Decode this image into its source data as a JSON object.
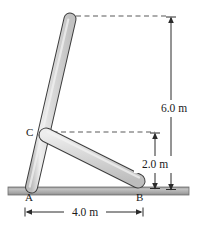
{
  "figure": {
    "title_fragment": "",
    "points": [
      {
        "id": "A",
        "label": "A",
        "x": 31,
        "y": 188,
        "text_x": 25,
        "text_y": 200
      },
      {
        "id": "B",
        "label": "B",
        "x": 140,
        "y": 186,
        "text_x": 137,
        "text_y": 200
      },
      {
        "id": "C",
        "label": "C",
        "x": 44,
        "y": 133,
        "text_x": 26,
        "text_y": 136
      }
    ],
    "dimensions": [
      {
        "id": "height-total",
        "label": "6.0 m",
        "value": 6.0,
        "unit": "m",
        "orientation": "vertical",
        "text_x": 174,
        "text_y": 108
      },
      {
        "id": "height-to-c",
        "label": "2.0 m",
        "value": 2.0,
        "unit": "m",
        "orientation": "vertical",
        "text_x": 158,
        "text_y": 165
      },
      {
        "id": "span-ab",
        "label": "4.0 m",
        "value": 4.0,
        "unit": "m",
        "orientation": "horizontal",
        "text_x": 84,
        "text_y": 216
      }
    ],
    "rods": [
      {
        "id": "rod-ac",
        "from": "A",
        "to": "top",
        "x1": 31,
        "y1": 188,
        "x2": 70,
        "y2": 19,
        "width": 11
      },
      {
        "id": "rod-cb",
        "from": "C",
        "to": "B",
        "x1": 45,
        "y1": 134,
        "x2": 139,
        "y2": 182,
        "width": 13
      }
    ],
    "ground": {
      "x": 8,
      "y": 187,
      "width": 181,
      "height": 8
    },
    "colors": {
      "rod_fill": "#d6d6d6",
      "rod_fill_light": "#ececec",
      "rod_stroke": "#404040",
      "ground_fill": "#b0b0b0",
      "ground_stroke": "#7a7a7a",
      "dash_stroke": "#555555",
      "dim_stroke": "#2b2b2b",
      "text": "#1a1a1a",
      "background": "#ffffff"
    },
    "dashed_lines": [
      {
        "id": "dash-top",
        "x1": 76,
        "y1": 16,
        "x2": 171,
        "y2": 16
      },
      {
        "id": "dash-mid",
        "x1": 40,
        "y1": 132,
        "x2": 157,
        "y2": 132
      }
    ]
  }
}
